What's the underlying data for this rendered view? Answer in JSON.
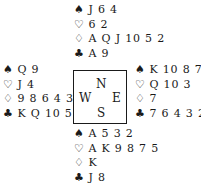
{
  "suits": {
    "spades": "♠",
    "hearts": "♡",
    "diamonds": "♢",
    "clubs": "♣"
  },
  "compass": {
    "north": "N",
    "south": "S",
    "west": "W",
    "east": "E"
  },
  "hands": {
    "north": {
      "spades": "J 6 4",
      "hearts": "6 2",
      "diamonds": "A Q J 10 5 2",
      "clubs": "A 9"
    },
    "west": {
      "spades": "Q 9",
      "hearts": "J 4",
      "diamonds": "9 8 6 4 3",
      "clubs": "K Q 10 5"
    },
    "east": {
      "spades": "K 10 8 7",
      "hearts": "Q 10 3",
      "diamonds": "7",
      "clubs": "7 6 4 3 2"
    },
    "south": {
      "spades": "A 5 3 2",
      "hearts": "A K 9 8 7 5",
      "diamonds": "K",
      "clubs": "J 8"
    }
  }
}
